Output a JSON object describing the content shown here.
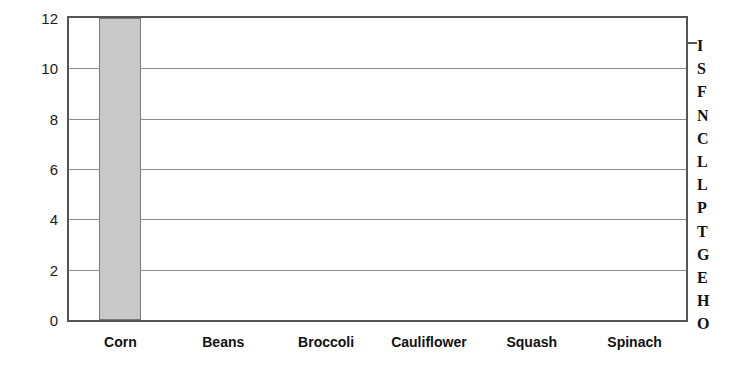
{
  "chart_data": {
    "type": "bar",
    "title": "",
    "xlabel": "",
    "ylabel": "",
    "categories": [
      "Corn",
      "Beans",
      "Broccoli",
      "Cauliflower",
      "Squash",
      "Spinach"
    ],
    "values": [
      12,
      0,
      0,
      0,
      0,
      0
    ],
    "ylim": [
      0,
      12
    ],
    "yticks": [
      0,
      2,
      4,
      6,
      8,
      10,
      12
    ],
    "ytick_labels": [
      "0",
      "2",
      "4",
      "6",
      "8",
      "10",
      "12"
    ],
    "grid": true,
    "grid_axis": "y",
    "legend": "none",
    "bar_color": "#c9c9c9",
    "bar_edge_color": "#7a7a7a",
    "frame_color": "#555555",
    "gridline_color": "#8c8c8c"
  },
  "side_label": {
    "text": "ISFNCLLPTGEHO",
    "letters": [
      "I",
      "S",
      "F",
      "N",
      "C",
      "L",
      "L",
      "P",
      "T",
      "G",
      "E",
      "H",
      "O"
    ]
  }
}
